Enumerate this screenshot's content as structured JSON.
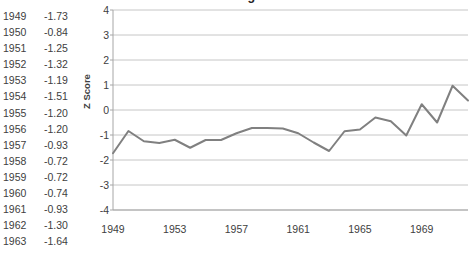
{
  "title": "Scaled Gage",
  "table": {
    "rows": [
      {
        "year": "1949",
        "value": "-1.73"
      },
      {
        "year": "1950",
        "value": "-0.84"
      },
      {
        "year": "1951",
        "value": "-1.25"
      },
      {
        "year": "1952",
        "value": "-1.32"
      },
      {
        "year": "1953",
        "value": "-1.19"
      },
      {
        "year": "1954",
        "value": "-1.51"
      },
      {
        "year": "1955",
        "value": "-1.20"
      },
      {
        "year": "1956",
        "value": "-1.20"
      },
      {
        "year": "1957",
        "value": "-0.93"
      },
      {
        "year": "1958",
        "value": "-0.72"
      },
      {
        "year": "1959",
        "value": "-0.72"
      },
      {
        "year": "1960",
        "value": "-0.74"
      },
      {
        "year": "1961",
        "value": "-0.93"
      },
      {
        "year": "1962",
        "value": "-1.30"
      },
      {
        "year": "1963",
        "value": "-1.64"
      }
    ]
  },
  "chart_data": {
    "type": "line",
    "title": "Scaled Gage",
    "xlabel": "",
    "ylabel": "Z Score",
    "ylim": [
      -4,
      4
    ],
    "yticks": [
      "4",
      "3",
      "2",
      "1",
      "0",
      "-1",
      "-2",
      "-3",
      "-4"
    ],
    "ytick_values": [
      4,
      3,
      2,
      1,
      0,
      -1,
      -2,
      -3,
      -4
    ],
    "xticks": [
      "1949",
      "1953",
      "1957",
      "1961",
      "1965",
      "1969"
    ],
    "xtick_values": [
      1949,
      1953,
      1957,
      1961,
      1965,
      1969
    ],
    "xlim": [
      1949,
      1972
    ],
    "grid": "horizontal",
    "legend": "none",
    "line_color": "#808080",
    "grid_color": "#bfbfbf",
    "x": [
      1949,
      1950,
      1951,
      1952,
      1953,
      1954,
      1955,
      1956,
      1957,
      1958,
      1959,
      1960,
      1961,
      1962,
      1963,
      1964,
      1965,
      1966,
      1967,
      1968,
      1969,
      1970,
      1971,
      1972
    ],
    "values": [
      -1.73,
      -0.84,
      -1.25,
      -1.32,
      -1.19,
      -1.51,
      -1.2,
      -1.2,
      -0.93,
      -0.72,
      -0.72,
      -0.74,
      -0.93,
      -1.3,
      -1.64,
      -0.85,
      -0.78,
      -0.3,
      -0.45,
      -1.02,
      0.23,
      -0.5,
      0.97,
      0.38
    ],
    "series": [
      {
        "name": "Z Score",
        "values": [
          -1.73,
          -0.84,
          -1.25,
          -1.32,
          -1.19,
          -1.51,
          -1.2,
          -1.2,
          -0.93,
          -0.72,
          -0.72,
          -0.74,
          -0.93,
          -1.3,
          -1.64,
          -0.85,
          -0.78,
          -0.3,
          -0.45,
          -1.02,
          0.23,
          -0.5,
          0.97,
          0.38
        ]
      }
    ]
  }
}
